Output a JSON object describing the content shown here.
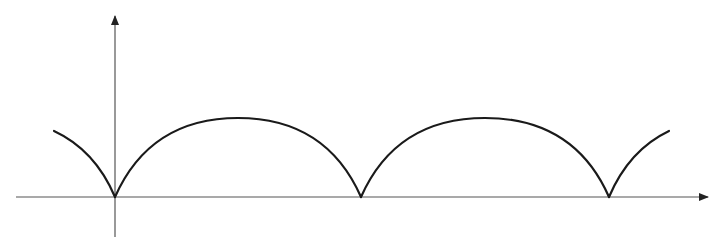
{
  "diagram": {
    "type": "function-graph",
    "colors": {
      "background": "#ffffff",
      "axis": "#555555",
      "curve": "#1a1a1a"
    },
    "axes": {
      "x_axis": {
        "y": 197,
        "x_start": 16,
        "x_end": 708,
        "arrow": "right"
      },
      "y_axis": {
        "x": 115,
        "y_start": 237,
        "y_end": 16,
        "arrow": "up"
      }
    },
    "curve": {
      "cusps": [
        [
          115,
          197
        ],
        [
          361,
          197
        ],
        [
          609,
          197
        ]
      ],
      "peak_y": 118,
      "left_stub_start": [
        54,
        131
      ],
      "right_stub_end": [
        669,
        131
      ]
    },
    "labels": []
  }
}
